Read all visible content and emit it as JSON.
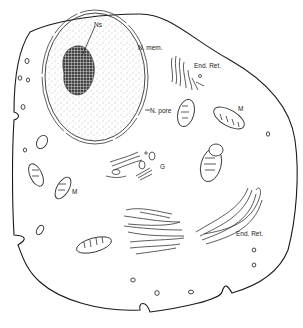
{
  "diagram": {
    "labels": {
      "nucleolus": "Ns",
      "nuclear_membrane": "N. mem.",
      "nuclear_pore": "N. pore",
      "er_top": "End. Ret.",
      "er_bottom": "End. Ret.",
      "mito_right": "M",
      "mito_left": "M",
      "golgi": "G"
    },
    "colors": {
      "line": "#1a1a1a",
      "stipple": "#555555",
      "background": "#ffffff"
    }
  },
  "caption": {
    "text": "",
    "note": "caption cropped at bottom edge"
  }
}
